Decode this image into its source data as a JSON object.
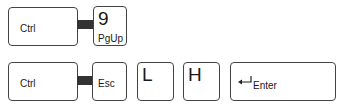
{
  "row1": {
    "ctrl": "Ctrl",
    "key2_main": "9",
    "key2_sub": "PgUp"
  },
  "row2": {
    "ctrl": "Ctrl",
    "esc": "Esc",
    "l": "L",
    "h": "H",
    "enter_arrow": "↵",
    "enter": "Enter"
  }
}
